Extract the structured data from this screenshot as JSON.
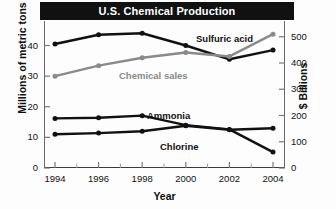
{
  "chart_data": {
    "type": "line",
    "title": "U.S. Chemical Production",
    "xlabel": "Year",
    "ylabel": "Millions of metric tons",
    "ylabel_right": "$ Billions",
    "x": [
      1994,
      1996,
      1998,
      2000,
      2002,
      2004
    ],
    "xtick_labels": [
      "1994",
      "1996",
      "1998",
      "2000",
      "2002",
      "2004"
    ],
    "xlim": [
      1993,
      2005
    ],
    "ylim": [
      0,
      48
    ],
    "ytick_labels": [
      "0",
      "10",
      "20",
      "30",
      "40"
    ],
    "yticks": [
      0,
      10,
      20,
      30,
      40
    ],
    "ylim_right": [
      0,
      560
    ],
    "ytick_labels_right": [
      "0",
      "100",
      "200",
      "300",
      "400",
      "500"
    ],
    "yticks_right": [
      0,
      100,
      200,
      300,
      400,
      500
    ],
    "grid": false,
    "legend_position": "inline-labels",
    "series": [
      {
        "name": "Sulfuric acid",
        "axis": "left",
        "color": "#111111",
        "label_x": 196,
        "label_y": 33,
        "values": [
          40.5,
          43.5,
          44.0,
          40.0,
          35.5,
          38.5
        ]
      },
      {
        "name": "Chemical sales",
        "axis": "right",
        "color": "#8a8a8a",
        "label_x": 119,
        "label_y": 70,
        "values": [
          350,
          390,
          420,
          440,
          425,
          510
        ]
      },
      {
        "name": "Ammonia",
        "axis": "left",
        "color": "#111111",
        "label_x": 147,
        "label_y": 110,
        "values": [
          16.2,
          16.4,
          17.1,
          14.0,
          12.6,
          5.2
        ]
      },
      {
        "name": "Chlorine",
        "axis": "left",
        "color": "#111111",
        "label_x": 160,
        "label_y": 141,
        "values": [
          11.0,
          11.4,
          12.0,
          13.8,
          12.5,
          13.0
        ]
      }
    ]
  },
  "colors": {
    "title_bar_bg": "#111111",
    "title_text": "#ffffff",
    "axis": "#3a3a3a",
    "primary_series": "#111111",
    "secondary_series": "#8a8a8a",
    "background": "#fdfdfd"
  }
}
